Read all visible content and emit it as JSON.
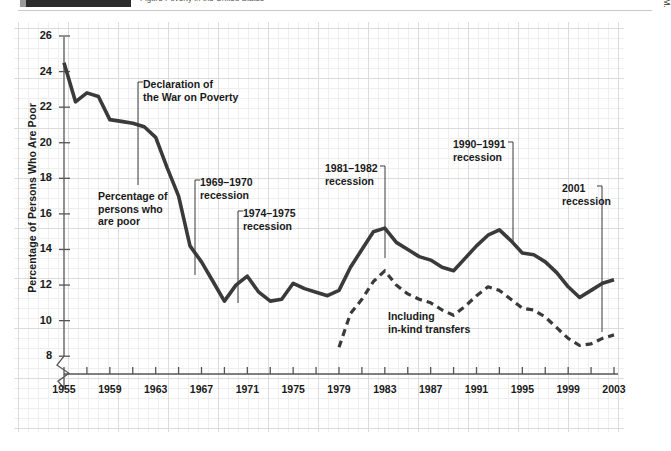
{
  "header": {
    "cut_off_title": "Figure  Poverty in the United States",
    "black_tab_label": ""
  },
  "source": {
    "text": "SOURCE: For 1959–2002, U.S. Bureau of the Census. For 1955–1958, estimates kindly provided by Gordon M. Fisher."
  },
  "annotations": [
    {
      "id": "declaration",
      "text": "Declaration of\nthe War on Poverty",
      "x": 129,
      "y": 56,
      "leader": {
        "x1": 124,
        "y1": 60,
        "x2": 124,
        "y2": 163,
        "side": "left"
      }
    },
    {
      "id": "series-label-solid",
      "text": "Percentage of\npersons who\nare poor",
      "x": 84,
      "y": 168,
      "leader": null
    },
    {
      "id": "rec-1969",
      "text": "1969–1970\nrecession",
      "x": 186,
      "y": 154,
      "leader": {
        "x1": 181,
        "y1": 158,
        "x2": 181,
        "y2": 253,
        "side": "left"
      }
    },
    {
      "id": "rec-1974",
      "text": "1974–1975\nrecession",
      "x": 229,
      "y": 185,
      "leader": {
        "x1": 224,
        "y1": 189,
        "x2": 224,
        "y2": 281,
        "side": "left"
      }
    },
    {
      "id": "rec-1981",
      "text": "1981–1982\nrecession",
      "x": 311,
      "y": 140,
      "leader": {
        "x1": 371,
        "y1": 144,
        "x2": 371,
        "y2": 236,
        "side": "right"
      }
    },
    {
      "id": "rec-1990",
      "text": "1990–1991\nrecession",
      "x": 439,
      "y": 116,
      "leader": {
        "x1": 499,
        "y1": 120,
        "x2": 499,
        "y2": 222,
        "side": "right"
      }
    },
    {
      "id": "rec-2001",
      "text": "2001\nrecession",
      "x": 548,
      "y": 160,
      "leader": {
        "x1": 588,
        "y1": 164,
        "x2": 588,
        "y2": 310,
        "side": "right"
      }
    },
    {
      "id": "series-label-dashed",
      "text": "Including\nin-kind transfers",
      "x": 374,
      "y": 288,
      "leader": null
    }
  ],
  "chart_data": {
    "type": "line",
    "title": "",
    "xlabel": "",
    "ylabel": "Percentage of Persons Who Are Poor",
    "xlim": [
      1955,
      2003
    ],
    "ylim": [
      7,
      26
    ],
    "y_ticks": [
      8,
      10,
      12,
      14,
      16,
      18,
      20,
      22,
      24,
      26
    ],
    "x_ticks": [
      1955,
      1957,
      1959,
      1961,
      1963,
      1965,
      1967,
      1969,
      1971,
      1973,
      1975,
      1977,
      1979,
      1981,
      1983,
      1985,
      1987,
      1989,
      1991,
      1993,
      1995,
      1997,
      1999,
      2001,
      2003
    ],
    "x_tick_labels": [
      1955,
      1959,
      1963,
      1967,
      1971,
      1975,
      1979,
      1983,
      1987,
      1991,
      1995,
      1999,
      2003
    ],
    "grid": true,
    "y_axis_break": true,
    "legend": "inline-annotations",
    "series": [
      {
        "name": "Percentage of persons who are poor",
        "style": "solid",
        "color": "#3a3a3a",
        "x": [
          1955,
          1956,
          1957,
          1958,
          1959,
          1960,
          1961,
          1962,
          1963,
          1964,
          1965,
          1966,
          1967,
          1968,
          1969,
          1970,
          1971,
          1972,
          1973,
          1974,
          1975,
          1976,
          1977,
          1978,
          1979,
          1980,
          1981,
          1982,
          1983,
          1984,
          1985,
          1986,
          1987,
          1988,
          1989,
          1990,
          1991,
          1992,
          1993,
          1994,
          1995,
          1996,
          1997,
          1998,
          1999,
          2000,
          2001,
          2002,
          2003
        ],
        "values": [
          24.5,
          22.3,
          22.8,
          22.6,
          21.3,
          21.2,
          21.1,
          20.9,
          20.3,
          18.6,
          17.0,
          14.2,
          13.3,
          12.2,
          11.1,
          12.0,
          12.5,
          11.6,
          11.1,
          11.2,
          12.1,
          11.8,
          11.6,
          11.4,
          11.7,
          13.0,
          14.0,
          15.0,
          15.2,
          14.4,
          14.0,
          13.6,
          13.4,
          13.0,
          12.8,
          13.5,
          14.2,
          14.8,
          15.1,
          14.5,
          13.8,
          13.7,
          13.3,
          12.7,
          11.9,
          11.3,
          11.7,
          12.1,
          12.3
        ]
      },
      {
        "name": "Including in-kind transfers",
        "style": "dashed",
        "color": "#3a3a3a",
        "x": [
          1979,
          1980,
          1981,
          1982,
          1983,
          1984,
          1985,
          1986,
          1987,
          1988,
          1989,
          1990,
          1991,
          1992,
          1993,
          1994,
          1995,
          1996,
          1997,
          1998,
          1999,
          2000,
          2001,
          2002,
          2003
        ],
        "values": [
          8.5,
          10.4,
          11.2,
          12.2,
          12.8,
          12.0,
          11.5,
          11.2,
          11.0,
          10.6,
          10.3,
          10.8,
          11.4,
          11.9,
          11.7,
          11.2,
          10.7,
          10.6,
          10.2,
          9.6,
          9.0,
          8.6,
          8.7,
          9.0,
          9.2
        ]
      }
    ]
  }
}
